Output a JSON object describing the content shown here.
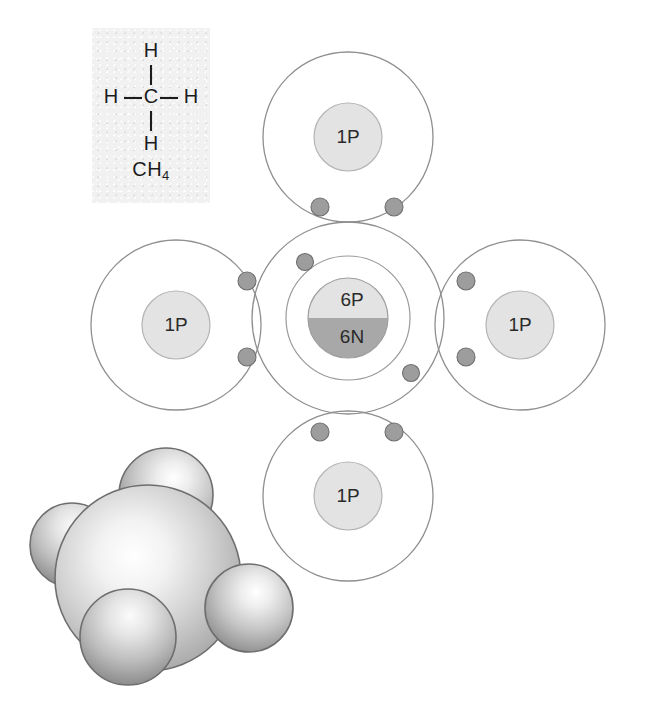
{
  "figure": {
    "name": "methane-bonding-figure",
    "molecule": "CH4"
  },
  "inset": {
    "name": "structural-formula-inset",
    "center_atom": "C",
    "top_atom": "H",
    "left_atom": "H",
    "right_atom": "H",
    "bottom_atom": "H",
    "formula_text": "CH",
    "formula_subscript": "4"
  },
  "bohr": {
    "carbon": {
      "label_protons": "6P",
      "label_neutrons": "6N",
      "inner_shell_electrons": 2,
      "outer_shell_electrons": 8
    },
    "hydrogens": [
      {
        "position": "top",
        "label": "1P"
      },
      {
        "position": "left",
        "label": "1P"
      },
      {
        "position": "right",
        "label": "1P"
      },
      {
        "position": "bottom",
        "label": "1P"
      }
    ],
    "shared_pairs": 4,
    "electrons_per_shared_pair": 2
  },
  "model": {
    "name": "space-filling-model",
    "central_atom": "C",
    "outer_atoms": [
      "H",
      "H",
      "H",
      "H"
    ],
    "geometry": "tetrahedral"
  },
  "colors": {
    "proton_fill": "#e3e3e3",
    "neutron_fill": "#a8a8a8",
    "electron_fill": "#9d9d9d",
    "shell_stroke": "#8f8f8f",
    "inset_background": "#f1f1f1",
    "text": "#1c1c1c",
    "sphere_light": "#ffffff",
    "sphere_mid": "#c9c9c9",
    "sphere_dark": "#8d8d8d"
  }
}
